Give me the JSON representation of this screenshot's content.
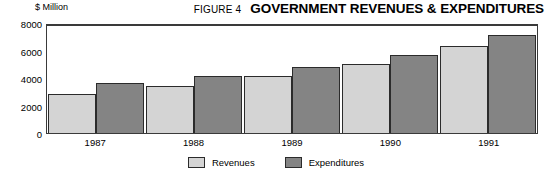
{
  "header": {
    "figure_number": "FIGURE 4",
    "title": "GOVERNMENT REVENUES & EXPENDITURES",
    "unit_label": "$ Million"
  },
  "legend": {
    "items": [
      {
        "label": "Revenues",
        "color": "#d4d4d4",
        "key": "revenues"
      },
      {
        "label": "Expenditures",
        "color": "#848484",
        "key": "expenditures"
      }
    ]
  },
  "chart_data": {
    "type": "bar",
    "title": "GOVERNMENT REVENUES & EXPENDITURES",
    "subtitle": "FIGURE 4",
    "xlabel": "",
    "ylabel": "$ Million",
    "categories": [
      "1987",
      "1988",
      "1989",
      "1990",
      "1991"
    ],
    "series": [
      {
        "name": "Revenues",
        "color": "#d4d4d4",
        "values": [
          2900,
          3500,
          4250,
          5150,
          6500
        ]
      },
      {
        "name": "Expenditures",
        "color": "#848484",
        "values": [
          3750,
          4300,
          4950,
          5850,
          7300
        ]
      }
    ],
    "ylim": [
      0,
      8000
    ],
    "yticks": [
      0,
      2000,
      4000,
      6000,
      8000
    ],
    "ytick_labels": [
      "0",
      "2000",
      "4000",
      "6000",
      "8000"
    ],
    "grid": false,
    "legend_position": "bottom-center"
  }
}
